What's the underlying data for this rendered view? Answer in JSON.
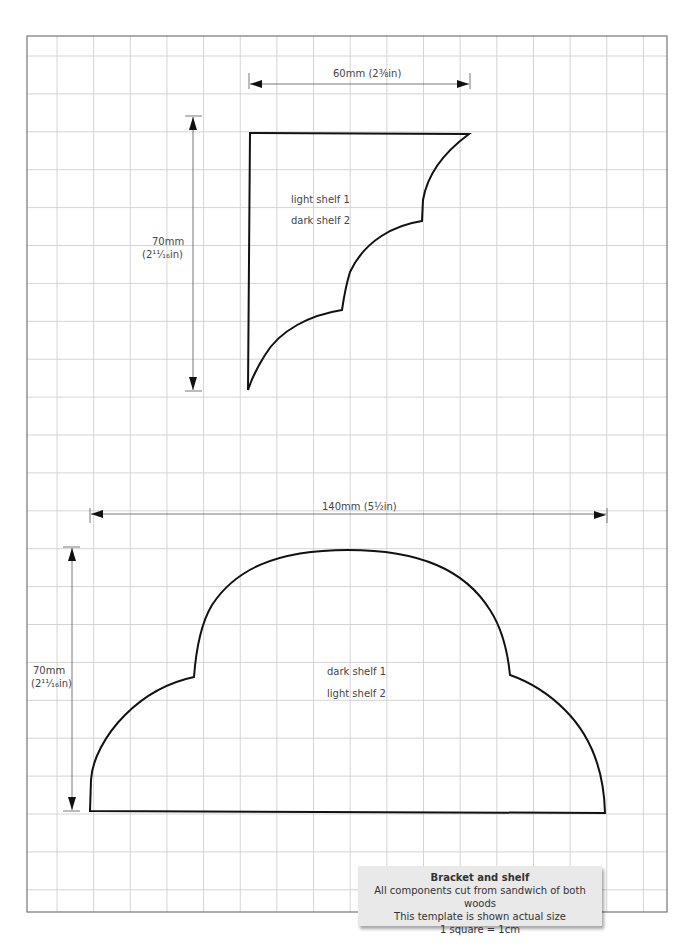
{
  "bracket": {
    "width_dimension": "60mm (2⅜in)",
    "height_dimension_mm": "70mm",
    "height_dimension_in": "(2¹¹⁄₁₆in)",
    "labels": [
      "light shelf 1",
      "dark shelf 2"
    ]
  },
  "shelf": {
    "width_dimension": "140mm (5½in)",
    "height_dimension_mm": "70mm",
    "height_dimension_in": "(2¹¹⁄₁₆in)",
    "labels": [
      "dark shelf 1",
      "light shelf 2"
    ]
  },
  "caption": {
    "title": "Bracket and shelf",
    "lines": [
      "All components cut from sandwich of both woods",
      "This template is shown actual size",
      "1 square = 1cm"
    ]
  },
  "colors": {
    "grid": "#d4d4d4",
    "border": "#777777",
    "outline": "#111111",
    "caption_bg": "#e9e9e9"
  }
}
